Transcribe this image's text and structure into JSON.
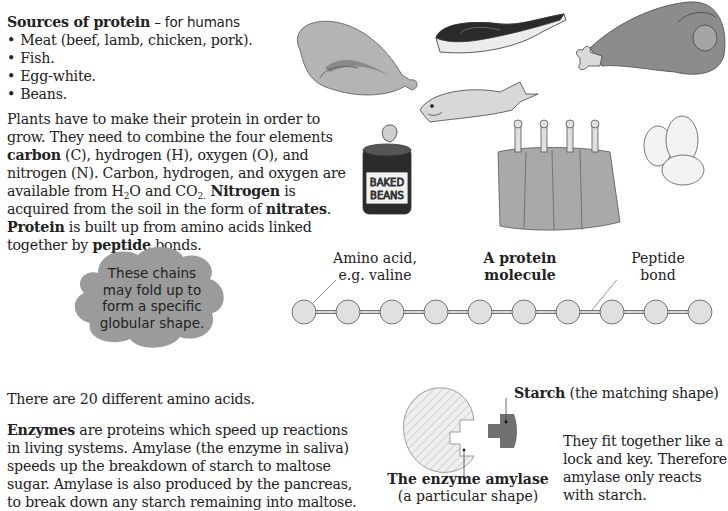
{
  "sources": {
    "title_bold": "Sources of protein",
    "title_rest": " – for humans",
    "items": [
      "Meat (beef, lamb, chicken, pork).",
      "Fish.",
      "Egg-white.",
      "Beans."
    ]
  },
  "plants": {
    "s1": "Plants have to make their protein in order to grow. They need to combine the four elements ",
    "carbon": "carbon",
    "s2": " (C), hydrogen (H), oxygen (O), and nitrogen (N). Carbon, hydrogen, and oxygen are available from H",
    "sub2": "2",
    "s3": "O and CO",
    "sub2b": "2.",
    "nitrogen": " Nitrogen",
    "s4": " is acquired from the soil in the form of ",
    "nitrates": "nitrates",
    "s5": ". ",
    "protein": "Protein",
    "s6": " is built up from amino acids linked together by ",
    "peptide": "peptide",
    "s7": " bonds."
  },
  "illustrations": {
    "beans_can_label_1": "BAKED",
    "beans_can_label_2": "BEANS",
    "items": [
      "chicken",
      "salmon-steak",
      "ham-leg",
      "fish",
      "baked-beans-can",
      "lamb-rack",
      "eggs"
    ]
  },
  "cloud": {
    "lines": [
      "These chains",
      "may fold up to",
      "form a specific",
      "globular shape."
    ]
  },
  "protein_chain": {
    "amino_label_1": "Amino acid,",
    "amino_label_2": "e.g. valine",
    "title_1": "A protein",
    "title_2": "molecule",
    "bond_label_1": "Peptide",
    "bond_label_2": "bond",
    "bead_count": 10
  },
  "amino_count_text": "There are 20 different amino acids.",
  "enzymes": {
    "bold": "Enzymes",
    "rest": " are proteins which speed up reactions in living systems. Amylase (the enzyme in saliva) speeds up the breakdown of starch to maltose sugar. Amylase is also produced by the pancreas, to break down any starch remaining into maltose."
  },
  "lock_key": {
    "starch_bold": "Starch",
    "starch_rest": " (the matching shape)",
    "enzyme_bold": "The enzyme amylase",
    "enzyme_sub": "(a particular shape)",
    "fit_text": "They fit together like a lock and key. Therefore amylase only reacts with starch."
  },
  "colors": {
    "food_grey": "#a8a8a8",
    "cloud_grey": "#9b9b9b",
    "bead_fill": "#e0e0e0",
    "starch_fill": "#707070"
  }
}
